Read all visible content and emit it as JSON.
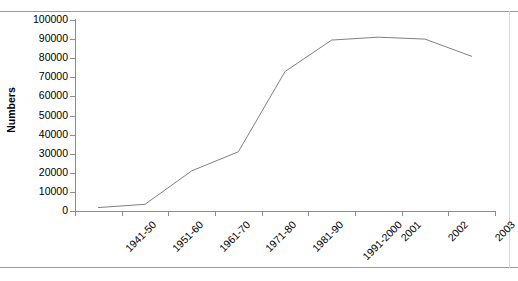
{
  "chart_data": {
    "type": "line",
    "title": "",
    "xlabel": "",
    "ylabel": "Numbers",
    "categories": [
      "1941-50",
      "1951-60",
      "1961-70",
      "1971-80",
      "1981-90",
      "1991-2000",
      "2001",
      "2002",
      "2003"
    ],
    "values": [
      1800,
      3500,
      21000,
      31000,
      73000,
      89500,
      91000,
      90000,
      81000
    ],
    "series": [
      {
        "name": "Numbers",
        "values": [
          1800,
          3500,
          21000,
          31000,
          73000,
          89500,
          91000,
          90000,
          81000
        ]
      }
    ],
    "ylim": [
      0,
      100000
    ],
    "ytick_labels": [
      "0",
      "10000",
      "20000",
      "30000",
      "40000",
      "50000",
      "60000",
      "70000",
      "80000",
      "90000",
      "100000"
    ],
    "ytick_values": [
      0,
      10000,
      20000,
      30000,
      40000,
      50000,
      60000,
      70000,
      80000,
      90000,
      100000
    ],
    "grid": false,
    "legend": "none",
    "line_color": "#808080",
    "axis_color": "#8c8c8c",
    "background_color": "#ffffff",
    "xtick_rotation": -45
  }
}
